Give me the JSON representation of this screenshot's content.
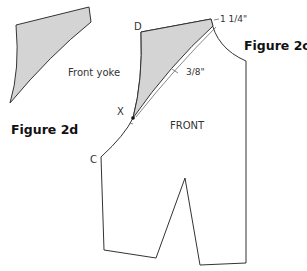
{
  "figures": {
    "fig_2c": "Figure 2c",
    "fig_2d": "Figure 2d"
  },
  "labels": {
    "front_yoke": "Front yoke",
    "front": "FRONT",
    "point_d": "D",
    "point_x": "X",
    "point_c": "C",
    "measure_shoulder": "1 1/4\"",
    "measure_offset": "3/8\""
  },
  "colors": {
    "line": "#333333",
    "fill": "#d4d4d4",
    "background": "#ffffff"
  }
}
